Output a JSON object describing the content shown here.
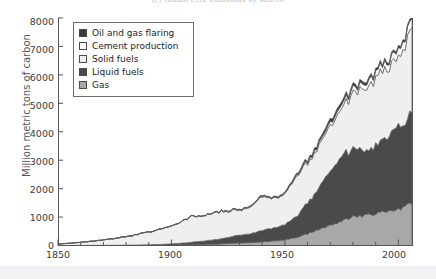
{
  "figure": {
    "caption_partial": "(c) Global CO2 emissions by source",
    "background_color": "#ffffff",
    "footer_band_color": "#f2f2f4"
  },
  "axes": {
    "ylabel": "Million metric tons of carbon",
    "xlabel": "",
    "yticks": [
      "0",
      "1000",
      "2000",
      "3000",
      "4000",
      "5000",
      "6000",
      "7000",
      "8000"
    ],
    "xticks": [
      "1850",
      "1900",
      "1950",
      "2000"
    ]
  },
  "legend": {
    "position": "upper-left-inside",
    "items": [
      {
        "label": "Oil and gas flaring",
        "color": "#3a3a3a",
        "swatch": "legend-swatch-oil-and-gas-flaring"
      },
      {
        "label": "Cement production",
        "color": "#ffffff",
        "swatch": "legend-swatch-cement-production"
      },
      {
        "label": "Solid fuels",
        "color": "#efefef",
        "swatch": "legend-swatch-solid-fuels"
      },
      {
        "label": "Liquid fuels",
        "color": "#4a4a4a",
        "swatch": "legend-swatch-liquid-fuels"
      },
      {
        "label": "Gas",
        "color": "#a8a8a8",
        "swatch": "legend-swatch-gas"
      }
    ]
  },
  "chart_data": {
    "type": "area",
    "stacked": true,
    "title": "(c) Global CO2 emissions by source",
    "xlabel": "",
    "ylabel": "Million metric tons of carbon",
    "xlim": [
      1850,
      2006
    ],
    "ylim": [
      0,
      8000
    ],
    "grid": false,
    "legend_position": "upper left",
    "x": [
      1850,
      1855,
      1860,
      1865,
      1870,
      1875,
      1880,
      1885,
      1890,
      1895,
      1900,
      1905,
      1910,
      1915,
      1920,
      1925,
      1930,
      1935,
      1940,
      1945,
      1950,
      1955,
      1960,
      1965,
      1970,
      1975,
      1980,
      1985,
      1990,
      1995,
      2000,
      2006
    ],
    "series": [
      {
        "name": "Gas",
        "color": "#a8a8a8",
        "stack_order": 1,
        "values": [
          0,
          0,
          0,
          0,
          1,
          2,
          3,
          5,
          8,
          12,
          18,
          25,
          35,
          45,
          55,
          70,
          90,
          100,
          130,
          160,
          200,
          290,
          420,
          560,
          740,
          870,
          1000,
          1060,
          1120,
          1190,
          1280,
          1500
        ]
      },
      {
        "name": "Liquid fuels",
        "color": "#4a4a4a",
        "stack_order": 2,
        "values": [
          0,
          0,
          1,
          2,
          3,
          5,
          8,
          12,
          18,
          26,
          40,
          60,
          90,
          120,
          160,
          220,
          280,
          310,
          400,
          450,
          520,
          740,
          1060,
          1420,
          2000,
          2240,
          2420,
          2200,
          2400,
          2650,
          2870,
          3100
        ]
      },
      {
        "name": "Solid fuels",
        "color": "#efefef",
        "stack_order": 3,
        "values": [
          54,
          80,
          110,
          150,
          190,
          240,
          300,
          370,
          450,
          540,
          640,
          780,
          920,
          870,
          960,
          930,
          880,
          980,
          1160,
          1010,
          1080,
          1380,
          1410,
          1490,
          1560,
          1740,
          1910,
          2150,
          2400,
          2380,
          2460,
          3100
        ]
      },
      {
        "name": "Cement production",
        "color": "#ffffff",
        "stack_order": 4,
        "values": [
          0,
          0,
          0,
          0,
          0,
          0,
          0,
          0,
          1,
          2,
          3,
          5,
          8,
          10,
          14,
          20,
          25,
          26,
          30,
          20,
          30,
          45,
          60,
          80,
          110,
          130,
          160,
          180,
          200,
          230,
          260,
          320
        ]
      },
      {
        "name": "Oil and gas flaring",
        "color": "#3a3a3a",
        "stack_order": 5,
        "values": [
          0,
          0,
          0,
          0,
          0,
          0,
          0,
          0,
          0,
          0,
          1,
          2,
          3,
          4,
          6,
          10,
          14,
          16,
          20,
          24,
          30,
          45,
          65,
          85,
          110,
          105,
          95,
          85,
          80,
          75,
          70,
          70
        ]
      }
    ],
    "cumulative_totals_at_2006": {
      "gas_top": 1500,
      "liquid_top": 4600,
      "solid_top": 7700,
      "cement_top": 7980,
      "flaring_top": 8050
    },
    "total_series_name": "Total emissions"
  }
}
